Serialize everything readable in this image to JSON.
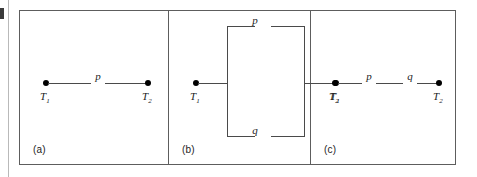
{
  "figure": {
    "type": "circuit-diagram-set",
    "panel_count": 3,
    "frame_color": "#5d5d5d",
    "wire_color": "#4a4a4a",
    "node_color": "#000000"
  },
  "panels": [
    {
      "caption": "(a)",
      "configuration": "single",
      "terminals": [
        {
          "label": "T",
          "subscript": "1"
        },
        {
          "label": "T",
          "subscript": "2"
        }
      ],
      "elements": [
        {
          "label": "p",
          "branch": "main"
        }
      ]
    },
    {
      "caption": "(b)",
      "configuration": "parallel",
      "terminals": [
        {
          "label": "T",
          "subscript": "1"
        },
        {
          "label": "T",
          "subscript": "2"
        }
      ],
      "elements": [
        {
          "label": "p",
          "branch": "top"
        },
        {
          "label": "q",
          "branch": "bottom"
        }
      ]
    },
    {
      "caption": "(c)",
      "configuration": "series",
      "terminals": [
        {
          "label": "T",
          "subscript": "1"
        },
        {
          "label": "T",
          "subscript": "2"
        }
      ],
      "elements": [
        {
          "label": "p",
          "branch": "main-left"
        },
        {
          "label": "q",
          "branch": "main-right"
        }
      ]
    }
  ]
}
